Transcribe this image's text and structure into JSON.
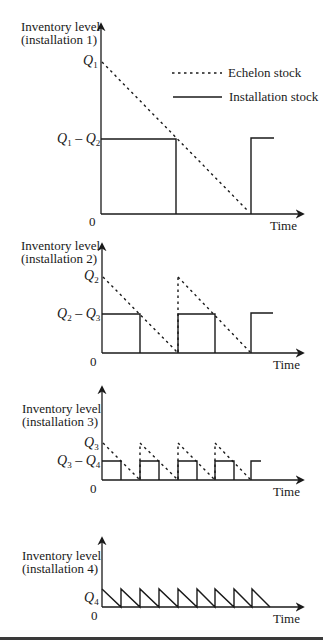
{
  "legend": {
    "echelon_label": "Echelon stock",
    "installation_label": "Installation stock"
  },
  "charts": [
    {
      "y_label_line1": "Inventory level",
      "y_label_line2": "(installation 1)",
      "x_label": "Time",
      "origin_label": "0",
      "upper_tick": {
        "main": "Q",
        "sub": "1"
      },
      "lower_tick": {
        "main1": "Q",
        "sub1": "1",
        "op": " – ",
        "main2": "Q",
        "sub2": "2"
      }
    },
    {
      "y_label_line1": "Inventory level",
      "y_label_line2": "(installation 2)",
      "x_label": "Time",
      "origin_label": "0",
      "upper_tick": {
        "main": "Q",
        "sub": "2"
      },
      "lower_tick": {
        "main1": "Q",
        "sub1": "2",
        "op": " – ",
        "main2": "Q",
        "sub2": "3"
      }
    },
    {
      "y_label_line1": "Inventory level",
      "y_label_line2": "(installation 3)",
      "x_label": "Time",
      "origin_label": "0",
      "upper_tick": {
        "main": "Q",
        "sub": "3"
      },
      "lower_tick": {
        "main1": "Q",
        "sub1": "3",
        "op": " – ",
        "main2": "Q",
        "sub2": "4"
      }
    },
    {
      "y_label_line1": "Inventory level",
      "y_label_line2": "(installation 4)",
      "x_label": "Time",
      "origin_label": "0",
      "upper_tick": {
        "main": "Q",
        "sub": "4"
      }
    }
  ]
}
